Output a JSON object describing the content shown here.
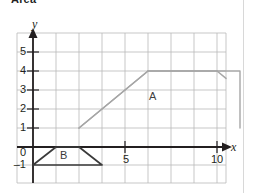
{
  "heading": "Area",
  "figure": {
    "axes": {
      "x_axis_label": "x",
      "y_axis_label": "y",
      "x_ticks": [
        {
          "value": 0,
          "label": "0"
        },
        {
          "value": 5,
          "label": "5"
        },
        {
          "value": 10,
          "label": "10"
        }
      ],
      "y_ticks": [
        {
          "value": 5,
          "label": "5"
        },
        {
          "value": 4,
          "label": "4"
        },
        {
          "value": 3,
          "label": "3"
        },
        {
          "value": 2,
          "label": "2"
        },
        {
          "value": 1,
          "label": "1"
        },
        {
          "value": -1,
          "label": "–1"
        }
      ],
      "x_range": [
        -1,
        13
      ],
      "y_range": [
        -2,
        6
      ],
      "grid": true
    },
    "shapes": [
      {
        "label": "A",
        "type": "trapezoid",
        "vertices": [
          [
            2,
            1
          ],
          [
            5,
            4
          ],
          [
            9,
            4
          ],
          [
            12,
            1
          ]
        ],
        "open_bottom": true,
        "color": "#a6a6a6",
        "label_position": [
          6.6,
          2.6
        ]
      },
      {
        "label": "B",
        "type": "trapezoid",
        "vertices": [
          [
            0,
            -1
          ],
          [
            1,
            0
          ],
          [
            2,
            0
          ],
          [
            3,
            -1
          ]
        ],
        "open_bottom": false,
        "color": "#3a3a3a",
        "label_position": [
          1.5,
          -0.5
        ]
      }
    ]
  },
  "colors": {
    "grid": "#b9b9b9",
    "axis": "#231f20",
    "shape_a": "#a6a6a6",
    "shape_b": "#3a3a3a",
    "text": "#231f20",
    "page_rule": "#d8d8d8"
  }
}
